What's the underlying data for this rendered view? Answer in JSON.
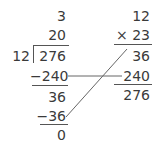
{
  "division": {
    "divisor": "12",
    "dividend": "276",
    "quotient_parts": [
      "3",
      "20"
    ],
    "steps": [
      {
        "subtract": "−240"
      },
      {
        "remainder": "36"
      },
      {
        "subtract": "−36"
      },
      {
        "remainder": "0"
      }
    ]
  },
  "multiplication": {
    "multiplicand": "12",
    "multiplier": "× 23",
    "partials": [
      "36",
      "240"
    ],
    "product": "276"
  },
  "colors": {
    "text": "#3a3a3a",
    "lines": "#555555"
  }
}
